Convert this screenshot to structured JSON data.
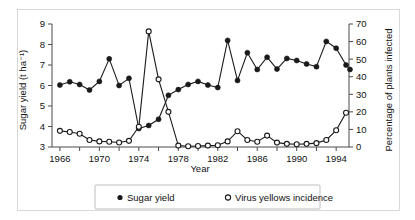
{
  "chart_data": {
    "type": "line",
    "title": "",
    "subtitle": "",
    "xlabel": "Year",
    "ylabel": "Sugar yield (t ha⁻¹)",
    "y2label": "Percentage of plants infected",
    "grid": false,
    "legend_position": "bottom",
    "xlim": [
      1965.2,
      1995.3
    ],
    "ylim": [
      3,
      9
    ],
    "y2lim": [
      0,
      70
    ],
    "xticks": [
      1966,
      1968,
      1970,
      1972,
      1974,
      1976,
      1978,
      1980,
      1982,
      1984,
      1986,
      1988,
      1990,
      1992,
      1994
    ],
    "xtick_labels": [
      "1966",
      "",
      "1970",
      "",
      "1974",
      "",
      "1978",
      "",
      "1982",
      "",
      "1986",
      "",
      "1990",
      "",
      "1994"
    ],
    "yticks": [
      3,
      4,
      5,
      6,
      7,
      8,
      9
    ],
    "ytick_labels": [
      "3",
      "4",
      "5",
      "6",
      "7",
      "8",
      "9"
    ],
    "y2ticks": [
      0,
      10,
      20,
      30,
      40,
      50,
      60,
      70
    ],
    "y2tick_labels": [
      "0",
      "10",
      "20",
      "30",
      "40",
      "50",
      "60",
      "70"
    ],
    "x": [
      1966,
      1967,
      1968,
      1969,
      1970,
      1971,
      1972,
      1973,
      1974,
      1975,
      1976,
      1977,
      1978,
      1979,
      1980,
      1981,
      1982,
      1983,
      1984,
      1985,
      1986,
      1987,
      1988,
      1989,
      1990,
      1991,
      1992,
      1993,
      1994,
      1995
    ],
    "series": [
      {
        "name": "Sugar yield",
        "axis": "left",
        "marker": "filled-circle",
        "color": "#1a1a1a",
        "units": "t ha⁻¹",
        "values": [
          6.02,
          6.18,
          6.05,
          5.78,
          6.2,
          7.3,
          6.0,
          6.35,
          3.9,
          4.05,
          4.35,
          5.52,
          5.8,
          6.05,
          6.2,
          6.02,
          5.9,
          8.2,
          6.25,
          7.6,
          6.78,
          7.38,
          6.8,
          7.32,
          7.22,
          7.05,
          6.92,
          8.15,
          7.82,
          7.0
        ]
      },
      {
        "name": "Virus yellows incidence",
        "axis": "right",
        "marker": "open-circle",
        "color": "#1a1a1a",
        "units": "% of plants infected",
        "values": [
          9.2,
          8.5,
          7.5,
          4.0,
          3.2,
          3.0,
          2.6,
          3.5,
          11.5,
          65.8,
          38.5,
          20.0,
          0.8,
          0.4,
          0.6,
          0.8,
          1.0,
          3.2,
          9.0,
          4.0,
          3.0,
          6.5,
          2.5,
          1.8,
          1.6,
          1.8,
          2.2,
          4.0,
          9.5,
          19.5
        ]
      }
    ],
    "series_extra_point": {
      "note": "sugar yield has one extra terminal point",
      "x_last": 1995.4,
      "y_last": 6.78
    }
  },
  "legend": {
    "items": [
      {
        "marker": "filled-circle",
        "label": "Sugar yield"
      },
      {
        "marker": "open-circle",
        "label": "Virus yellows incidence"
      }
    ]
  }
}
